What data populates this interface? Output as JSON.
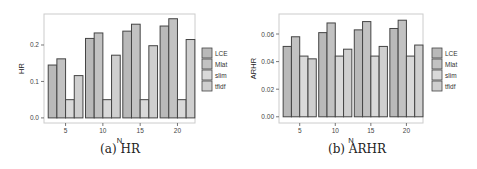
{
  "chart_data": [
    {
      "type": "bar",
      "title": "",
      "caption": "(a) HR",
      "xlabel": "N",
      "ylabel": "HR",
      "categories": [
        "5",
        "10",
        "15",
        "20"
      ],
      "series": [
        {
          "name": "LCE",
          "values": [
            0.145,
            0.218,
            0.238,
            0.252
          ]
        },
        {
          "name": "Mlat",
          "values": [
            0.162,
            0.233,
            0.257,
            0.272
          ]
        },
        {
          "name": "slim",
          "values": [
            0.05,
            0.05,
            0.05,
            0.05
          ]
        },
        {
          "name": "tfidf",
          "values": [
            0.116,
            0.172,
            0.198,
            0.215
          ]
        }
      ],
      "yticks": [
        0.0,
        0.1,
        0.2
      ],
      "ytick_labels": [
        "0.0",
        "0.1",
        "0.2"
      ],
      "ylim": [
        -0.014,
        0.285
      ],
      "grid": false,
      "legend_position": "right"
    },
    {
      "type": "bar",
      "title": "",
      "caption": "(b) ARHR",
      "xlabel": "N",
      "ylabel": "ARHR",
      "categories": [
        "5",
        "10",
        "15",
        "20"
      ],
      "series": [
        {
          "name": "LCE",
          "values": [
            0.051,
            0.061,
            0.063,
            0.064
          ]
        },
        {
          "name": "Mlat",
          "values": [
            0.058,
            0.068,
            0.069,
            0.07
          ]
        },
        {
          "name": "slim",
          "values": [
            0.044,
            0.044,
            0.044,
            0.044
          ]
        },
        {
          "name": "tfidf",
          "values": [
            0.042,
            0.049,
            0.051,
            0.052
          ]
        }
      ],
      "yticks": [
        0.0,
        0.02,
        0.04,
        0.06
      ],
      "ytick_labels": [
        "0.00",
        "0.02",
        "0.04",
        "0.06"
      ],
      "ylim": [
        -0.0045,
        0.0745
      ],
      "grid": false,
      "legend_position": "right"
    }
  ],
  "colors": {
    "LCE": "#b9b9b9",
    "Mlat": "#c2c2c2",
    "slim": "#d9d9d9",
    "tfidf": "#cfcfcf",
    "bar_stroke": "#444444",
    "panel_border": "#cccccc"
  }
}
